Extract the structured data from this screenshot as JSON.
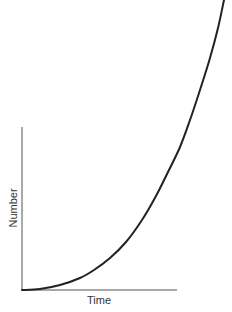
{
  "chart_data": {
    "type": "line",
    "title": "",
    "xlabel": "Time",
    "ylabel": "Number",
    "grid": false,
    "legend": null,
    "series": [
      {
        "name": "growth",
        "color": "#222222",
        "points_px": [
          [
            22,
            290
          ],
          [
            40,
            289
          ],
          [
            60,
            285
          ],
          [
            80,
            278
          ],
          [
            94,
            270
          ],
          [
            110,
            258
          ],
          [
            126,
            242
          ],
          [
            142,
            220
          ],
          [
            156,
            196
          ],
          [
            168,
            172
          ],
          [
            180,
            147
          ],
          [
            190,
            120
          ],
          [
            200,
            90
          ],
          [
            210,
            58
          ],
          [
            218,
            28
          ],
          [
            224,
            0
          ]
        ]
      }
    ],
    "axes": {
      "origin_px": [
        22,
        290
      ],
      "x_end_px": 177,
      "y_top_px": 127,
      "color": "#555555"
    }
  }
}
